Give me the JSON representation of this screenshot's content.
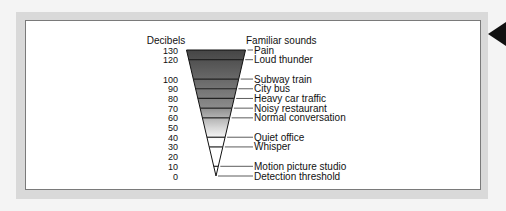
{
  "chart_data": {
    "type": "funnel",
    "title": "",
    "left_header": "Decibels",
    "right_header": "Familiar sounds",
    "scale": [
      130,
      120,
      100,
      90,
      80,
      70,
      60,
      50,
      40,
      30,
      20,
      10,
      0
    ],
    "sounds": [
      {
        "db": 130,
        "label": "Pain"
      },
      {
        "db": 120,
        "label": "Loud thunder"
      },
      {
        "db": 100,
        "label": "Subway train"
      },
      {
        "db": 90,
        "label": "City bus"
      },
      {
        "db": 80,
        "label": "Heavy car traffic"
      },
      {
        "db": 70,
        "label": "Noisy restaurant"
      },
      {
        "db": 60,
        "label": "Normal conversation"
      },
      {
        "db": 40,
        "label": "Quiet office"
      },
      {
        "db": 30,
        "label": "Whisper"
      },
      {
        "db": 10,
        "label": "Motion picture studio"
      },
      {
        "db": 0,
        "label": "Detection threshold"
      }
    ],
    "colors": {
      "top": "#4a4a4a",
      "bottom": "#ffffff"
    }
  }
}
